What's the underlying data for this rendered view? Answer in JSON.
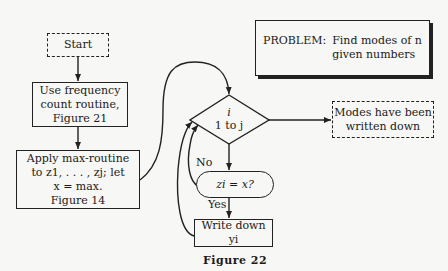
{
  "problem": {
    "label": "PROBLEM:",
    "line1": "Find modes of n",
    "line2": "given numbers"
  },
  "nodes": {
    "start": "Start",
    "frequency": [
      "Use frequency",
      "count routine,",
      "Figure 21"
    ],
    "apply_max": [
      "Apply max-routine",
      "to z1, . . . , zj; let",
      "x = max.",
      "Figure 14"
    ],
    "loop": {
      "var": "i",
      "range": "1 to j"
    },
    "test": "zi = x?",
    "write": "Write down yi",
    "end": [
      "Modes have been",
      "written down"
    ]
  },
  "edge_labels": {
    "no": "No",
    "yes": "Yes"
  },
  "caption": "Figure 22"
}
